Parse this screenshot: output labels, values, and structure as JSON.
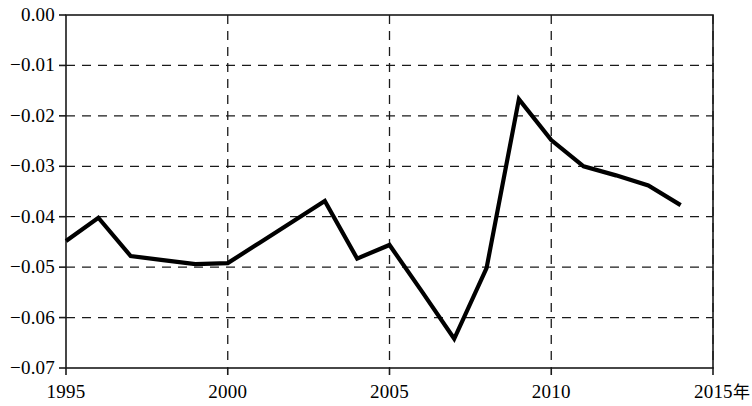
{
  "chart_data": {
    "type": "line",
    "title": "",
    "subtitle": "",
    "xlabel": "年",
    "ylabel": "",
    "xlim": [
      1995,
      2015
    ],
    "ylim": [
      -0.07,
      0.0
    ],
    "grid": true,
    "legend": null,
    "x_ticks": [
      "1995",
      "2000",
      "2005",
      "2010",
      "2015"
    ],
    "x_tick_values": [
      1995,
      2000,
      2005,
      2010,
      2015
    ],
    "y_ticks": [
      "0.00",
      "−0.01",
      "−0.02",
      "−0.03",
      "−0.04",
      "−0.05",
      "−0.06",
      "−0.07"
    ],
    "y_tick_values": [
      0.0,
      -0.01,
      -0.02,
      -0.03,
      -0.04,
      -0.05,
      -0.06,
      -0.07
    ],
    "series": [
      {
        "name": "series-1",
        "color": "#000000",
        "x": [
          1995,
          1996,
          1997,
          1998,
          1999,
          2000,
          2001,
          2002,
          2003,
          2004,
          2005,
          2006,
          2007,
          2008,
          2009,
          2010,
          2011,
          2012,
          2013,
          2014
        ],
        "values": [
          -0.0448,
          -0.0402,
          -0.0478,
          -0.0486,
          -0.0494,
          -0.0492,
          -0.0451,
          -0.041,
          -0.0369,
          -0.0483,
          -0.0456,
          -0.0548,
          -0.0642,
          -0.0502,
          -0.0167,
          -0.0248,
          -0.03,
          -0.0318,
          -0.0338,
          -0.0377
        ]
      }
    ]
  },
  "axis": {
    "x_unit_label": "年"
  }
}
